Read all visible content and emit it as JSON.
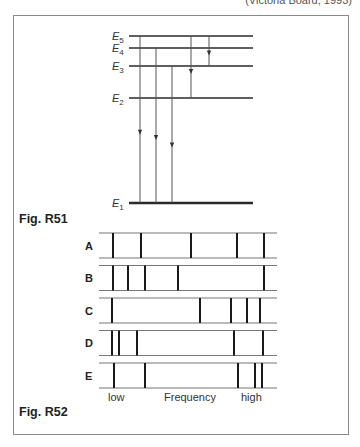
{
  "citation": "(Victoria Board, 1993)",
  "figure_r51": {
    "caption": "Fig. R51",
    "levels": [
      {
        "name": "E5",
        "base": "E",
        "sub": "5",
        "y": 36
      },
      {
        "name": "E4",
        "base": "E",
        "sub": "4",
        "y": 48
      },
      {
        "name": "E3",
        "base": "E",
        "sub": "3",
        "y": 66
      },
      {
        "name": "E2",
        "base": "E",
        "sub": "2",
        "y": 98
      },
      {
        "name": "E1",
        "base": "E",
        "sub": "1",
        "y": 203
      }
    ],
    "transitions": [
      {
        "from": "E5",
        "to": "E1",
        "x": 140
      },
      {
        "from": "E4",
        "to": "E1",
        "x": 156
      },
      {
        "from": "E3",
        "to": "E1",
        "x": 172
      },
      {
        "from": "E5",
        "to": "E2",
        "x": 191
      },
      {
        "from": "E5",
        "to": "E3",
        "x": 209
      }
    ]
  },
  "figure_r52": {
    "caption": "Fig. R52",
    "axis": {
      "low": "low",
      "label": "Frequency",
      "high": "high"
    },
    "spectra": [
      {
        "label": "A",
        "lines": [
          113,
          141,
          191,
          237,
          264
        ]
      },
      {
        "label": "B",
        "lines": [
          113,
          128,
          145,
          178,
          264
        ]
      },
      {
        "label": "C",
        "lines": [
          112,
          200,
          231,
          247,
          260
        ]
      },
      {
        "label": "D",
        "lines": [
          112,
          119,
          137,
          234,
          263
        ]
      },
      {
        "label": "E",
        "lines": [
          114,
          145,
          238,
          255,
          262
        ]
      }
    ]
  }
}
